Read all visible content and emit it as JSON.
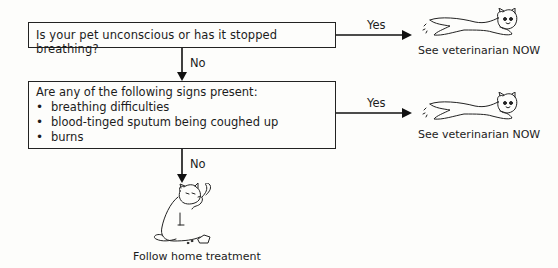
{
  "flowchart": {
    "question_1": {
      "text": "Is your pet unconscious or has it stopped breathing?",
      "yes_label": "Yes",
      "no_label": "No"
    },
    "question_2": {
      "text": "Are any of the following signs present:",
      "signs": [
        "breathing difficulties",
        "blood-tinged sputum being coughed up",
        "burns"
      ],
      "yes_label": "Yes",
      "no_label": "No"
    },
    "outcomes": {
      "yes_1": {
        "caption": "See veterinarian NOW",
        "icon": "running-cat-icon"
      },
      "yes_2": {
        "caption": "See veterinarian NOW",
        "icon": "running-cat-icon"
      },
      "no_final": {
        "caption": "Follow home treatment",
        "icon": "cat-with-bottle-icon"
      }
    }
  }
}
